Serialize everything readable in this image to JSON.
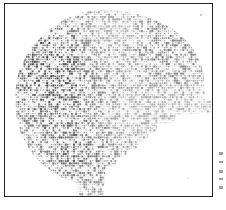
{
  "figure": {
    "medium": "monospaced typewriter / line-printer character art",
    "orientation": "profile facing right",
    "background_color": "#ffffff",
    "ink_color": "#1d1d1d",
    "frame": {
      "present": true,
      "color": "#262626",
      "stroke_width_px": 1.4,
      "left_px": 4,
      "top_px": 3,
      "width_px": 209,
      "height_px": 194
    },
    "canvas": {
      "width_px": 226,
      "height_px": 210
    }
  },
  "ascii_art": {
    "glyph_width_px": 2.05,
    "glyph_height_px": 2.35,
    "row_count": 78,
    "column_count": 100,
    "character_set": "#@%8&WM0QB$Ndbqpkhao*+=:-. ",
    "density_note": "darker clusters in cranium, hair mass and jaw; lighter values across brow, cheek and crown",
    "regions": [
      {
        "name": "crown",
        "tone": "light"
      },
      {
        "name": "cranium",
        "tone": "dark"
      },
      {
        "name": "occiput",
        "tone": "medium-dark"
      },
      {
        "name": "brow",
        "tone": "medium"
      },
      {
        "name": "cheek",
        "tone": "light"
      },
      {
        "name": "nose-step",
        "tone": "medium"
      },
      {
        "name": "jaw",
        "tone": "dark"
      },
      {
        "name": "neck",
        "tone": "medium"
      }
    ]
  },
  "scan_artifacts": {
    "margin_ticks": [
      {
        "top_px": 152,
        "height_px": 3
      },
      {
        "top_px": 161,
        "height_px": 2
      },
      {
        "top_px": 170,
        "height_px": 3
      },
      {
        "top_px": 178,
        "height_px": 2
      },
      {
        "top_px": 186,
        "height_px": 3
      }
    ],
    "speck_positions": [
      {
        "left_px": 200,
        "top_px": 14
      },
      {
        "left_px": 188,
        "top_px": 178
      }
    ]
  }
}
